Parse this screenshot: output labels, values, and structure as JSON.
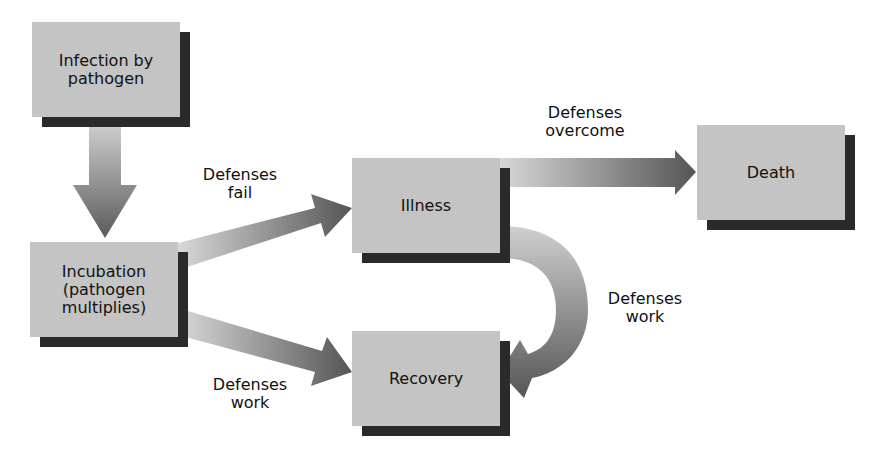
{
  "diagram": {
    "type": "flowchart",
    "title": "",
    "nodes": [
      {
        "id": "infection",
        "label": "Infection by\npathogen"
      },
      {
        "id": "incubation",
        "label": "Incubation\n(pathogen\nmultiplies)"
      },
      {
        "id": "illness",
        "label": "Illness"
      },
      {
        "id": "recovery",
        "label": "Recovery"
      },
      {
        "id": "death",
        "label": "Death"
      }
    ],
    "edges": [
      {
        "from": "infection",
        "to": "incubation",
        "label": ""
      },
      {
        "from": "incubation",
        "to": "illness",
        "label": "Defenses\nfail"
      },
      {
        "from": "incubation",
        "to": "recovery",
        "label": "Defenses\nwork"
      },
      {
        "from": "illness",
        "to": "death",
        "label": "Defenses\novercome"
      },
      {
        "from": "illness",
        "to": "recovery",
        "label": "Defenses\nwork"
      }
    ]
  },
  "colors": {
    "box_fill": "#c4c4c4",
    "box_shadow": "#2a2a2a",
    "arrow_light": "#d6d6d6",
    "arrow_dark": "#5a5a5a"
  }
}
